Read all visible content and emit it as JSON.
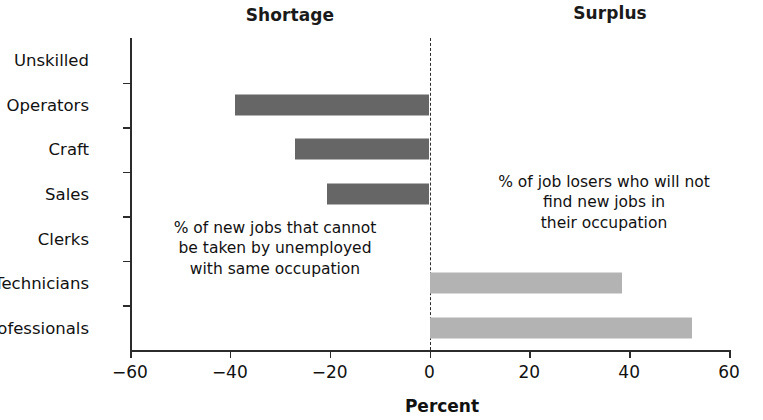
{
  "headers": {
    "left": "Shortage",
    "right": "Surplus"
  },
  "annotations": {
    "left": "% of new jobs that cannot\nbe taken by unemployed\nwith same occupation",
    "right": "% of job losers who will not\nfind new jobs in\ntheir occupation"
  },
  "colors": {
    "shortage_bar": "#666666",
    "surplus_bar": "#b3b3b3",
    "axis": "#2b2b2b",
    "text": "#111111",
    "background": "#ffffff"
  },
  "chart_data": {
    "type": "bar",
    "orientation": "horizontal",
    "title": "",
    "xlabel": "Percent",
    "ylabel": "",
    "xlim": [
      -60,
      60
    ],
    "xticks": [
      -60,
      -40,
      -20,
      0,
      20,
      40,
      60
    ],
    "xticklabels": [
      "−60",
      "−40",
      "−20",
      "0",
      "20",
      "40",
      "60"
    ],
    "grid": false,
    "legend": false,
    "categories": [
      "Unskilled",
      "Operators",
      "Craft",
      "Sales",
      "Clerks",
      "Technicians",
      "Professionals"
    ],
    "values": [
      0,
      -39,
      -27,
      -20.5,
      0,
      38.5,
      52.5
    ],
    "series": [
      {
        "name": "Shortage",
        "color": "#666666",
        "values": [
          0,
          -39,
          -27,
          -20.5,
          0,
          0,
          0
        ]
      },
      {
        "name": "Surplus",
        "color": "#b3b3b3",
        "values": [
          0,
          0,
          0,
          0,
          0,
          38.5,
          52.5
        ]
      }
    ]
  }
}
